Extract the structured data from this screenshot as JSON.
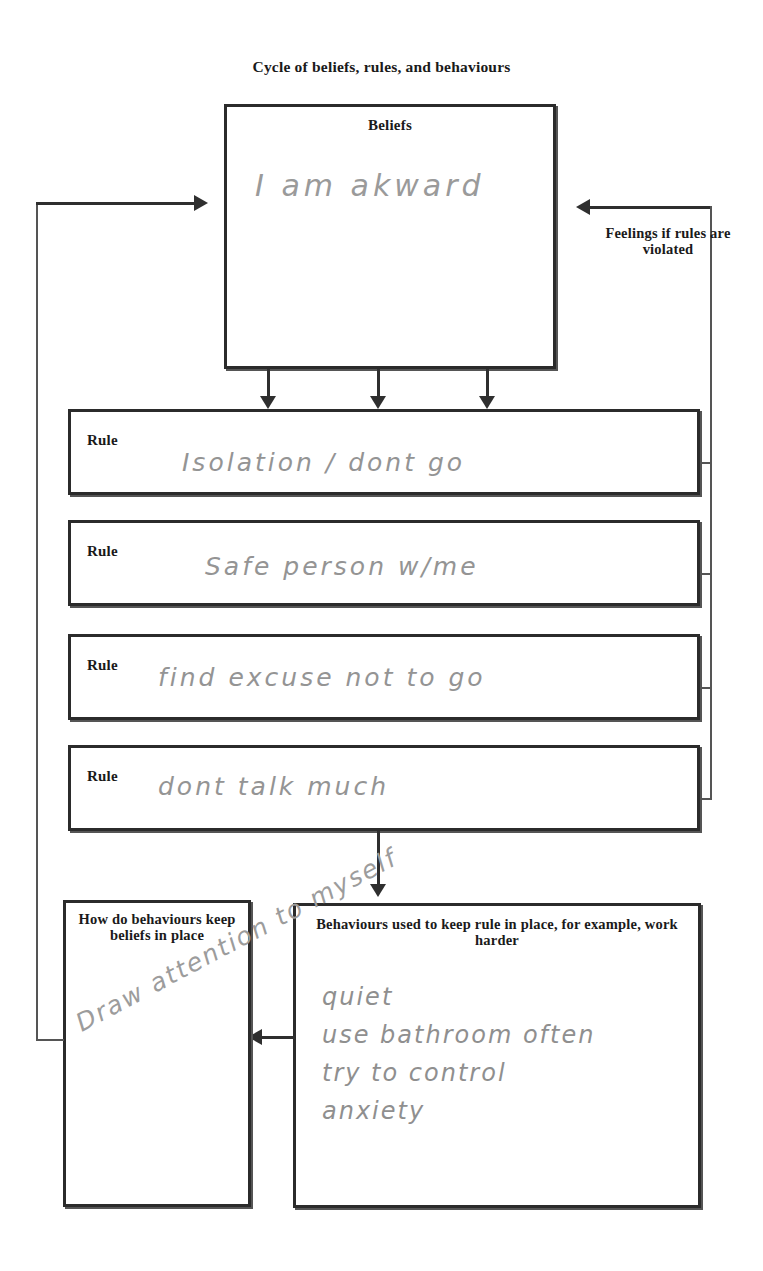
{
  "diagram": {
    "title": "Cycle of beliefs, rules, and behaviours",
    "type": "cbt-cycle-worksheet"
  },
  "beliefs": {
    "heading": "Beliefs",
    "handwritten_entry": "I am akward"
  },
  "rules": {
    "label": "Rule",
    "items": [
      {
        "label": "Rule",
        "handwritten_entry": "Isolation / dont go"
      },
      {
        "label": "Rule",
        "handwritten_entry": "Safe person w/me"
      },
      {
        "label": "Rule",
        "handwritten_entry": "find excuse not to go"
      },
      {
        "label": "Rule",
        "handwritten_entry": "dont talk much"
      }
    ]
  },
  "behaviours": {
    "heading": "Behaviours used to keep rule in place, for example, work harder",
    "handwritten_entry": "quiet\nuse bathroom often\ntry to control\nanxiety"
  },
  "keep_beliefs": {
    "heading": "How do behaviours keep beliefs in place",
    "handwritten_entry": "Draw attention to myself"
  },
  "connectors": {
    "feelings_label": "Feelings if rules are violated"
  },
  "colors": {
    "ink_printed": "#1a1a1a",
    "ink_handwriting": "#949494",
    "box_border": "#2b2b2b",
    "connector": "#2f2f2f",
    "background": "#ffffff"
  }
}
